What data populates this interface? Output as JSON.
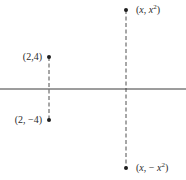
{
  "diagram": {
    "axis": {
      "orientation": "horizontal",
      "y": 89,
      "x_start": 0,
      "x_end": 186,
      "color": "#3a3a3a"
    },
    "segments": [
      {
        "name": "left-dashed-segment",
        "x": 49,
        "y_top": 57,
        "y_bottom": 120
      },
      {
        "name": "right-dashed-segment",
        "x": 126,
        "y_top": 10,
        "y_bottom": 168
      }
    ],
    "points": [
      {
        "name": "point-2-4",
        "x": 49,
        "y": 57,
        "label": "(2,4)"
      },
      {
        "name": "point-2-neg4",
        "x": 49,
        "y": 120,
        "label": "(2, −4)"
      },
      {
        "name": "point-x-x2",
        "x": 126,
        "y": 10,
        "label_prefix": "(",
        "label_var": "x",
        "label_sep": ", ",
        "label_term": "x",
        "label_exp": "2",
        "label_suffix": ")"
      },
      {
        "name": "point-x-negx2",
        "x": 126,
        "y": 168,
        "label_prefix": "(",
        "label_var": "x",
        "label_sep": ", − ",
        "label_term": "x",
        "label_exp": "2",
        "label_suffix": ")"
      }
    ],
    "labels": {
      "p1": "(2,4)",
      "p2": "(2, −4)",
      "p3": {
        "open": "(",
        "var": "x",
        "sep": ", ",
        "term": "x",
        "exp": "2",
        "close": ")"
      },
      "p4": {
        "open": "(",
        "var": "x",
        "sep": ", − ",
        "term": "x",
        "exp": "2",
        "close": ")"
      }
    },
    "colors": {
      "line": "#3a3a3a",
      "dot": "#1e1e1e",
      "text": "#2a2a2a",
      "background": "#ffffff"
    }
  }
}
